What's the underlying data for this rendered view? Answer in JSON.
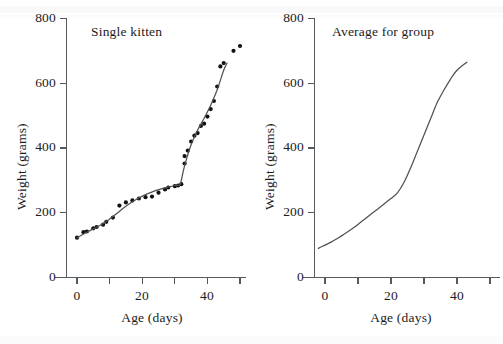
{
  "figure": {
    "panels": [
      {
        "key": "single-kitten",
        "title": "Single kitten",
        "xlabel": "Age (days)",
        "ylabel": "Weight (grams)"
      },
      {
        "key": "average-for-group",
        "title": "Average for group",
        "xlabel": "Age (days)",
        "ylabel": "Weight (grams)"
      }
    ],
    "y_ticks": [
      "0",
      "200",
      "400",
      "600",
      "800"
    ],
    "x_ticks": [
      "0",
      "20",
      "40"
    ]
  },
  "chart_data": [
    {
      "type": "scatter",
      "panel": "Single kitten",
      "title": "Single kitten",
      "xlabel": "Age (days)",
      "ylabel": "Weight (grams)",
      "xlim": [
        -3,
        53
      ],
      "ylim": [
        0,
        800
      ],
      "x_ticks": [
        0,
        20,
        40
      ],
      "x_minor_ticks": [
        10,
        30,
        50
      ],
      "y_ticks": [
        0,
        200,
        400,
        600,
        800
      ],
      "grid": false,
      "legend": "none",
      "series": [
        {
          "name": "Observed weights",
          "type": "scatter",
          "marker": "filled-circle",
          "points": [
            [
              0,
              123
            ],
            [
              2,
              140
            ],
            [
              3,
              142
            ],
            [
              5,
              152
            ],
            [
              6,
              156
            ],
            [
              8,
              163
            ],
            [
              9,
              172
            ],
            [
              11,
              185
            ],
            [
              13,
              222
            ],
            [
              15,
              232
            ],
            [
              17,
              238
            ],
            [
              19,
              244
            ],
            [
              21,
              248
            ],
            [
              23,
              250
            ],
            [
              25,
              262
            ],
            [
              27,
              272
            ],
            [
              28,
              278
            ],
            [
              30,
              282
            ],
            [
              31,
              284
            ],
            [
              32,
              288
            ],
            [
              33,
              352
            ],
            [
              33,
              375
            ],
            [
              34,
              392
            ],
            [
              35,
              420
            ],
            [
              36,
              438
            ],
            [
              37,
              446
            ],
            [
              38,
              468
            ],
            [
              39,
              475
            ],
            [
              40,
              497
            ],
            [
              41,
              520
            ],
            [
              42,
              545
            ],
            [
              43,
              590
            ],
            [
              44,
              652
            ],
            [
              45,
              662
            ],
            [
              48,
              700
            ],
            [
              50,
              715
            ]
          ]
        },
        {
          "name": "Fitted growth curve",
          "type": "line",
          "points": [
            [
              0,
              123
            ],
            [
              3,
              140
            ],
            [
              6,
              155
            ],
            [
              9,
              173
            ],
            [
              12,
              196
            ],
            [
              15,
              220
            ],
            [
              18,
              240
            ],
            [
              21,
              256
            ],
            [
              24,
              268
            ],
            [
              27,
              277
            ],
            [
              30,
              284
            ],
            [
              31.5,
              286
            ],
            [
              32,
              300
            ],
            [
              33,
              345
            ],
            [
              35,
              410
            ],
            [
              37,
              455
            ],
            [
              39,
              492
            ],
            [
              41,
              532
            ],
            [
              43,
              580
            ],
            [
              45,
              640
            ],
            [
              46,
              662
            ]
          ]
        }
      ]
    },
    {
      "type": "line",
      "panel": "Average for group",
      "title": "Average for group",
      "xlabel": "Age (days)",
      "ylabel": "Weight (grams)",
      "xlim": [
        -3,
        53
      ],
      "ylim": [
        0,
        800
      ],
      "x_ticks": [
        0,
        20,
        40
      ],
      "x_minor_ticks": [
        10,
        30,
        50
      ],
      "y_ticks": [
        0,
        200,
        400,
        600,
        800
      ],
      "grid": false,
      "legend": "none",
      "series": [
        {
          "name": "Average weight",
          "type": "line",
          "points": [
            [
              -2,
              90
            ],
            [
              0,
              100
            ],
            [
              2,
              110
            ],
            [
              4,
              122
            ],
            [
              6,
              135
            ],
            [
              8,
              149
            ],
            [
              10,
              164
            ],
            [
              12,
              180
            ],
            [
              14,
              196
            ],
            [
              16,
              212
            ],
            [
              18,
              228
            ],
            [
              20,
              244
            ],
            [
              22,
              262
            ],
            [
              24,
              295
            ],
            [
              26,
              340
            ],
            [
              28,
              390
            ],
            [
              30,
              440
            ],
            [
              32,
              490
            ],
            [
              34,
              540
            ],
            [
              36,
              578
            ],
            [
              38,
              612
            ],
            [
              40,
              640
            ],
            [
              43,
              665
            ]
          ]
        }
      ]
    }
  ]
}
